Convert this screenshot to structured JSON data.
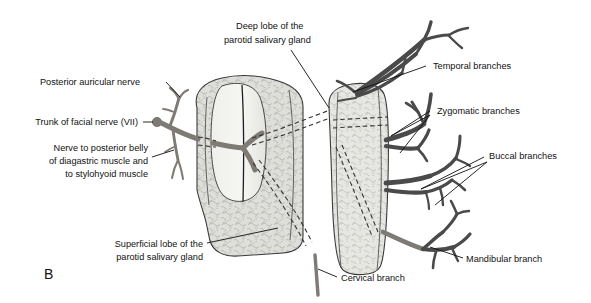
{
  "figure": {
    "panel_letter": "B",
    "background_color": "#ffffff",
    "text_color": "#111111",
    "nerve_dark_color": "#4a4a4a",
    "nerve_mid_color": "#7e7a74",
    "gland_fill_color": "#dcdcd8",
    "gland_stroke_color": "#3a3a3a"
  },
  "labels": {
    "deep_lobe": {
      "line1": "Deep lobe of the",
      "line2": "parotid salivary gland"
    },
    "posterior_auricular": {
      "line1": "Posterior auricular nerve"
    },
    "trunk_facial": {
      "line1": "Trunk of facial nerve (VII)"
    },
    "nerve_digastric": {
      "line1": "Nerve to posterior belly",
      "line2": "of diagastric muscle and",
      "line3": "to stylohyoid muscle"
    },
    "superficial_lobe": {
      "line1": "Superficial lobe of the",
      "line2": "parotid salivary gland"
    },
    "temporal": {
      "line1": "Temporal branches"
    },
    "zygomatic": {
      "line1": "Zygomatic branches"
    },
    "buccal": {
      "line1": "Buccal branches"
    },
    "mandibular": {
      "line1": "Mandibular branch"
    },
    "cervical": {
      "line1": "Cervical branch"
    }
  }
}
